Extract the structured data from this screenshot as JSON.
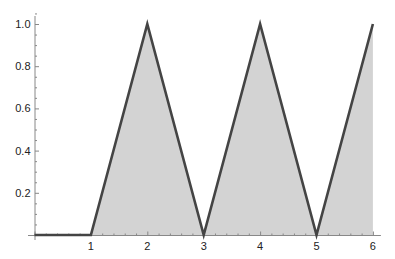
{
  "chart_data": {
    "type": "area",
    "title": "",
    "xlabel": "",
    "ylabel": "",
    "x": [
      0,
      1,
      2,
      3,
      4,
      5,
      6
    ],
    "series": [
      {
        "name": "triangle wave",
        "values": [
          0,
          0,
          1,
          0,
          1,
          0,
          1
        ]
      }
    ],
    "x_ticks": [
      "1",
      "2",
      "3",
      "4",
      "5",
      "6"
    ],
    "y_ticks": [
      "0.2",
      "0.4",
      "0.6",
      "0.8",
      "1.0"
    ],
    "xlim": [
      0,
      6
    ],
    "ylim": [
      0,
      1.05
    ],
    "grid": false,
    "legend": "none",
    "colors": {
      "line": "#444444",
      "fill": "#d3d3d3",
      "axis": "#888888"
    }
  }
}
